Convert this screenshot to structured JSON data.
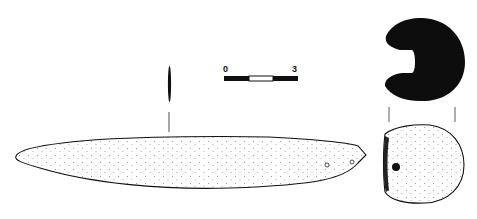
{
  "figure": {
    "type": "archaeological-artifact-drawing",
    "scale_bar": {
      "start_label": "0",
      "end_label": "3",
      "segments": [
        "black",
        "white",
        "black"
      ]
    },
    "views": [
      {
        "name": "profile-section-long",
        "description": "narrow black section line above the long object"
      },
      {
        "name": "plan-view-elongated",
        "description": "stippled elongated tapering object with two small perforations near right end"
      },
      {
        "name": "cross-section",
        "description": "solid black C-shaped section"
      },
      {
        "name": "end-view",
        "description": "stippled rounded end view with single dark dot"
      }
    ]
  }
}
